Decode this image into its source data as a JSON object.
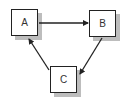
{
  "diagram": {
    "nodes": [
      {
        "id": "A",
        "label": "A"
      },
      {
        "id": "B",
        "label": "B"
      },
      {
        "id": "C",
        "label": "C"
      }
    ],
    "edges": [
      {
        "from": "A",
        "to": "B"
      },
      {
        "from": "B",
        "to": "C"
      },
      {
        "from": "C",
        "to": "A"
      }
    ]
  }
}
